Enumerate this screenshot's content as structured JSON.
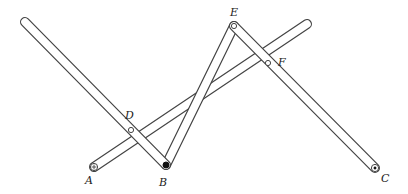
{
  "diagram": {
    "title": "",
    "colors": {
      "stroke": "#444444",
      "fill": "#ffffff",
      "pin": "#111111"
    },
    "bar_width": 10,
    "points": {
      "A": {
        "label": "A",
        "x": 94,
        "y": 167,
        "lx": 85,
        "ly": 184
      },
      "B": {
        "label": "B",
        "x": 166,
        "y": 165,
        "lx": 159,
        "ly": 186
      },
      "C": {
        "label": "C",
        "x": 375,
        "y": 168,
        "lx": 381,
        "ly": 182
      },
      "D": {
        "label": "D",
        "x": 131,
        "y": 130,
        "lx": 125,
        "ly": 119
      },
      "E": {
        "label": "E",
        "x": 234,
        "y": 26,
        "lx": 230,
        "ly": 16
      },
      "F": {
        "label": "F",
        "x": 268,
        "y": 63,
        "lx": 278,
        "ly": 66
      }
    },
    "bars": [
      {
        "name": "bar-left-long",
        "from": [
          25,
          22
        ],
        "to": [
          166,
          165
        ]
      },
      {
        "name": "bar-A-to-top-right",
        "from": [
          94,
          167
        ],
        "to": [
          307,
          24
        ]
      },
      {
        "name": "bar-B-to-E",
        "from": [
          166,
          165
        ],
        "to": [
          234,
          26
        ]
      },
      {
        "name": "bar-E-to-C",
        "from": [
          234,
          26
        ],
        "to": [
          375,
          168
        ]
      }
    ]
  }
}
